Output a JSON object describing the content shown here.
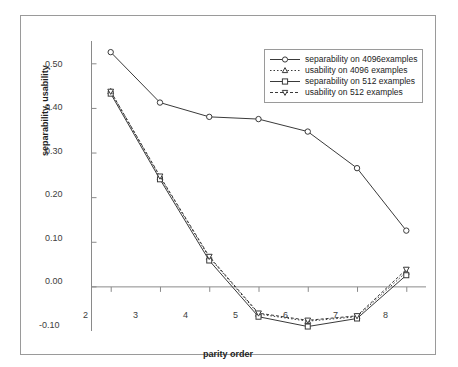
{
  "chart_data": {
    "type": "line",
    "title": "",
    "xlabel": "parity order",
    "ylabel": "separability, usability",
    "categories": [
      2,
      3,
      4,
      5,
      6,
      7,
      8
    ],
    "x_tick_labels": [
      "2",
      "3",
      "4",
      "5",
      "6",
      "7",
      "8"
    ],
    "y_tick_labels": [
      "0.50",
      "0.40",
      "0.30",
      "0.20",
      "0.10",
      "0.00",
      "-0.10"
    ],
    "y_tick_values": [
      0.5,
      0.4,
      0.3,
      0.2,
      0.1,
      0.0,
      -0.1
    ],
    "ylim": [
      -0.1,
      0.55
    ],
    "xlim": [
      1.6,
      8.4
    ],
    "grid": false,
    "legend_position": "top-right",
    "zero_line": true,
    "series": [
      {
        "name": "separability on 4096examples",
        "marker": "circle",
        "linestyle": "solid",
        "color": "#3a3a3a",
        "values": [
          0.525,
          0.412,
          0.38,
          0.375,
          0.347,
          0.265,
          0.125
        ]
      },
      {
        "name": "usability on 4096 examples",
        "marker": "triangle-up",
        "linestyle": "dotted",
        "color": "#3a3a3a",
        "values": [
          0.437,
          0.245,
          0.065,
          -0.062,
          -0.078,
          -0.068,
          0.032
        ]
      },
      {
        "name": "separability on 512 examples",
        "marker": "square",
        "linestyle": "solid",
        "color": "#3a3a3a",
        "values": [
          0.432,
          0.24,
          0.058,
          -0.068,
          -0.09,
          -0.072,
          0.025
        ]
      },
      {
        "name": "usability on 512 examples",
        "marker": "triangle-down",
        "linestyle": "dashed",
        "color": "#3a3a3a",
        "values": [
          0.437,
          0.247,
          0.067,
          -0.06,
          -0.076,
          -0.066,
          0.038
        ]
      }
    ]
  },
  "legend": {
    "items": [
      {
        "label": "separability on 4096examples"
      },
      {
        "label": "usability on 4096 examples"
      },
      {
        "label": "separability on 512 examples"
      },
      {
        "label": "usability on 512 examples"
      }
    ]
  }
}
